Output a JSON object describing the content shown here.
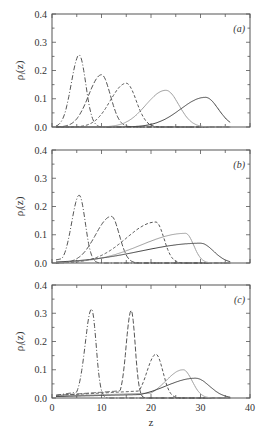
{
  "chart_data": [
    {
      "type": "line",
      "panel_label": "(a)",
      "ylabel": "ρi(z)",
      "xlabel": "",
      "xlim": [
        0,
        40
      ],
      "ylim": [
        0,
        0.4
      ],
      "yticks": [
        "0.0",
        "0.1",
        "0.2",
        "0.3",
        "0.4"
      ],
      "series": [
        {
          "name": "dash-dot",
          "style": "dashdot",
          "color": "#555555",
          "peak_z": 5.5,
          "peak": 0.255,
          "sigma_left": 1.6,
          "sigma_right": 1.3,
          "base": 0.0
        },
        {
          "name": "long-dash",
          "style": "longdash",
          "color": "#555555",
          "peak_z": 10.0,
          "peak": 0.185,
          "sigma_left": 2.6,
          "sigma_right": 1.8,
          "base": 0.0
        },
        {
          "name": "short-dash",
          "style": "shortdash",
          "color": "#555555",
          "peak_z": 15.0,
          "peak": 0.155,
          "sigma_left": 3.2,
          "sigma_right": 2.0,
          "base": 0.0
        },
        {
          "name": "gray-solid",
          "style": "solid",
          "color": "#a0a0a0",
          "peak_z": 23.0,
          "peak": 0.13,
          "sigma_left": 4.0,
          "sigma_right": 2.6,
          "base": 0.0
        },
        {
          "name": "dark-solid",
          "style": "solid",
          "color": "#444444",
          "peak_z": 31.0,
          "peak": 0.105,
          "sigma_left": 5.0,
          "sigma_right": 2.6,
          "base": 0.0
        }
      ]
    },
    {
      "type": "line",
      "panel_label": "(b)",
      "ylabel": "ρi(z)",
      "xlabel": "",
      "xlim": [
        0,
        40
      ],
      "ylim": [
        0,
        0.4
      ],
      "yticks": [
        "0.0",
        "0.1",
        "0.2",
        "0.3",
        "0.4"
      ],
      "series": [
        {
          "name": "dash-dot",
          "style": "dashdot",
          "color": "#555555",
          "peak_z": 5.5,
          "peak": 0.24,
          "sigma_left": 1.5,
          "sigma_right": 1.2,
          "base": 0.02
        },
        {
          "name": "long-dash",
          "style": "longdash",
          "color": "#555555",
          "peak_z": 12.0,
          "peak": 0.165,
          "sigma_left": 3.2,
          "sigma_right": 1.6,
          "base": 0.0
        },
        {
          "name": "short-dash",
          "style": "shortdash",
          "color": "#555555",
          "peak_z": 21.0,
          "peak": 0.145,
          "sigma_left": 6.0,
          "sigma_right": 1.6,
          "base": 0.0
        },
        {
          "name": "gray-solid",
          "style": "solid",
          "color": "#a0a0a0",
          "peak_z": 27.0,
          "peak": 0.105,
          "sigma_left": 9.0,
          "sigma_right": 1.6,
          "base": 0.0
        },
        {
          "name": "dark-solid",
          "style": "solid",
          "color": "#444444",
          "peak_z": 30.0,
          "peak": 0.07,
          "sigma_left": 12.0,
          "sigma_right": 2.6,
          "base": 0.0
        }
      ]
    },
    {
      "type": "line",
      "panel_label": "(c)",
      "ylabel": "ρi(z)",
      "xlabel": "z",
      "xlim": [
        0,
        40
      ],
      "ylim": [
        0,
        0.4
      ],
      "xticks": [
        "0",
        "10",
        "20",
        "30",
        "40"
      ],
      "yticks": [
        "0.0",
        "0.1",
        "0.2",
        "0.3",
        "0.4"
      ],
      "series": [
        {
          "name": "dash-dot",
          "style": "dashdot",
          "color": "#555555",
          "peak_z": 8.0,
          "peak": 0.315,
          "sigma_left": 1.3,
          "sigma_right": 0.9,
          "base": 0.02
        },
        {
          "name": "long-dash",
          "style": "longdash",
          "color": "#555555",
          "peak_z": 16.0,
          "peak": 0.31,
          "sigma_left": 1.0,
          "sigma_right": 0.8,
          "base": 0.02
        },
        {
          "name": "short-dash",
          "style": "shortdash",
          "color": "#555555",
          "peak_z": 21.0,
          "peak": 0.155,
          "sigma_left": 1.8,
          "sigma_right": 1.4,
          "base": 0.02
        },
        {
          "name": "gray-solid",
          "style": "solid",
          "color": "#a0a0a0",
          "peak_z": 26.5,
          "peak": 0.1,
          "sigma_left": 3.5,
          "sigma_right": 1.8,
          "base": 0.015
        },
        {
          "name": "dark-solid",
          "style": "solid",
          "color": "#444444",
          "peak_z": 29.0,
          "peak": 0.07,
          "sigma_left": 6.0,
          "sigma_right": 2.8,
          "base": 0.012
        }
      ]
    }
  ],
  "labels": {
    "ylabel_main": "ρ",
    "ylabel_sub": "i",
    "ylabel_tail": "(z)",
    "xlabel": "z"
  }
}
